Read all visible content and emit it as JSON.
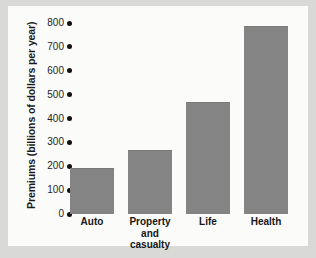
{
  "chart_data": {
    "type": "bar",
    "title": "",
    "xlabel": "",
    "ylabel": "Premiums (billions of dollars per year)",
    "categories": [
      "Auto",
      "Property\nand casualty",
      "Life",
      "Health"
    ],
    "values": [
      190,
      265,
      465,
      785
    ],
    "ylim": [
      0,
      800
    ],
    "yticks": [
      "0",
      "100",
      "200",
      "300",
      "400",
      "500",
      "600",
      "700",
      "800"
    ],
    "ytick_values": [
      0,
      100,
      200,
      300,
      400,
      500,
      600,
      700,
      800
    ],
    "grid": false,
    "legend": false,
    "bar_color": "#848484",
    "panel_color": "#fbfbfa",
    "figure_color": "#d9d9d7",
    "tick_marker": "dot"
  }
}
